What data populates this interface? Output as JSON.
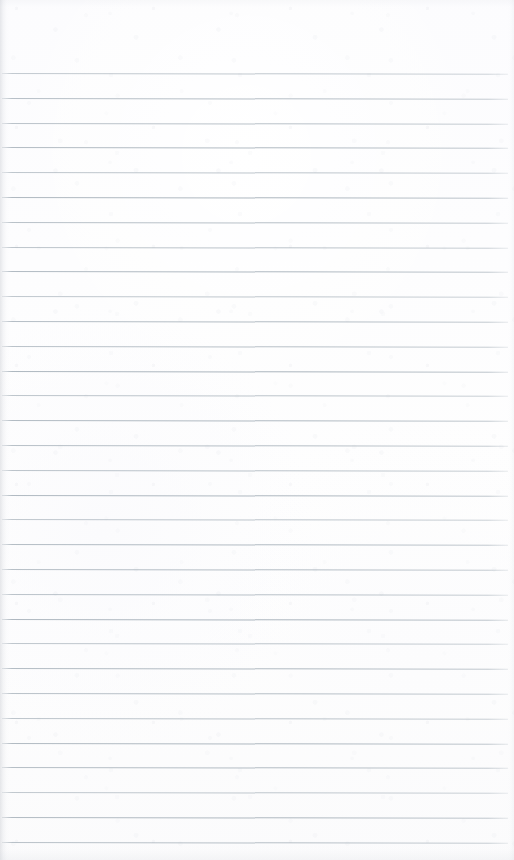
{
  "document": {
    "kind": "ruled-notepad-page",
    "title": "Blank ruled notepad page",
    "state": "blank",
    "visible_text": "",
    "orientation": "portrait"
  },
  "page": {
    "width_px": 514,
    "height_px": 860,
    "paper_color": "#fdfdfe",
    "paper_tint": "#fcfcfd",
    "edge_shadow_color": "#b0b4bc"
  },
  "ruling": {
    "line_color": "#9aa6b0",
    "line_thickness_px": 1,
    "line_count": 32,
    "first_line_y_px": 73,
    "last_line_y_px": 842,
    "line_spacing_px": 24.8,
    "line_start_x_px": 2,
    "line_end_x_px": 508,
    "skew_degrees": 0.085,
    "line_opacities": [
      0.62,
      0.74,
      0.7,
      0.78,
      0.66,
      0.82,
      0.72,
      0.68,
      0.8,
      0.64,
      0.76,
      0.71,
      0.84,
      0.67,
      0.79,
      0.73,
      0.69,
      0.81,
      0.65,
      0.77,
      0.74,
      0.7,
      0.83,
      0.66,
      0.78,
      0.72,
      0.68,
      0.8,
      0.75,
      0.63,
      0.79,
      0.71
    ]
  },
  "margins": {
    "header_label": "top margin",
    "header_height_px": 73,
    "footer_label": "bottom margin",
    "footer_height_px": 17,
    "left_margin_px": 2,
    "right_margin_px": 6,
    "left_rule_present": false,
    "right_rule_present": false
  },
  "writing_area": {
    "label": "writing area",
    "top_px": 73,
    "height_px": 770,
    "content": ""
  }
}
